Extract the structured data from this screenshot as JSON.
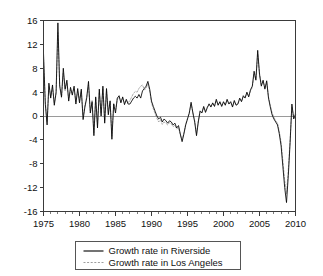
{
  "chart_data": {
    "type": "line",
    "title": "",
    "subtitle": "",
    "xlabel": "",
    "ylabel": "",
    "xlim": [
      1975,
      2010
    ],
    "ylim": [
      -16,
      16
    ],
    "grid": false,
    "zero_line": true,
    "legend_position": "bottom-center",
    "x_ticks": [
      1975,
      1980,
      1985,
      1990,
      1995,
      2000,
      2005,
      2010
    ],
    "x_tick_labels": [
      "1975",
      "1980",
      "1985",
      "1990",
      "1995",
      "2000",
      "2005",
      "2010"
    ],
    "x_minor_tick_step": 1,
    "y_ticks": [
      16,
      12,
      8,
      4,
      0,
      -4,
      -8,
      -12,
      -16
    ],
    "y_tick_labels": [
      "16",
      "12",
      "8",
      "4",
      "0",
      "-4",
      "-8",
      "-12",
      "-16"
    ],
    "colors": {
      "riverside": "#000000",
      "los_angeles": "#9d9d9d",
      "axis": "#3a3a3a",
      "zero_line": "#9a9a9a",
      "background": "#ffffff"
    },
    "series": [
      {
        "name": "Growth rate in Riverside",
        "style": "solid",
        "color": "#000000",
        "x": [
          1975.0,
          1975.25,
          1975.5,
          1975.75,
          1976.0,
          1976.25,
          1976.5,
          1976.75,
          1977.0,
          1977.25,
          1977.5,
          1977.75,
          1978.0,
          1978.25,
          1978.5,
          1978.75,
          1979.0,
          1979.25,
          1979.5,
          1979.75,
          1980.0,
          1980.25,
          1980.5,
          1980.75,
          1981.0,
          1981.25,
          1981.5,
          1981.75,
          1982.0,
          1982.25,
          1982.5,
          1982.75,
          1983.0,
          1983.25,
          1983.5,
          1983.75,
          1984.0,
          1984.25,
          1984.5,
          1984.75,
          1985.0,
          1985.25,
          1985.5,
          1985.75,
          1986.0,
          1986.25,
          1986.5,
          1986.75,
          1987.0,
          1987.25,
          1987.5,
          1987.75,
          1988.0,
          1988.25,
          1988.5,
          1988.75,
          1989.0,
          1989.25,
          1989.5,
          1989.75,
          1990.0,
          1990.25,
          1990.5,
          1990.75,
          1991.0,
          1991.25,
          1991.5,
          1991.75,
          1992.0,
          1992.25,
          1992.5,
          1992.75,
          1993.0,
          1993.25,
          1993.5,
          1993.75,
          1994.0,
          1994.25,
          1994.5,
          1994.75,
          1995.0,
          1995.25,
          1995.5,
          1995.75,
          1996.0,
          1996.25,
          1996.5,
          1996.75,
          1997.0,
          1997.25,
          1997.5,
          1997.75,
          1998.0,
          1998.25,
          1998.5,
          1998.75,
          1999.0,
          1999.25,
          1999.5,
          1999.75,
          2000.0,
          2000.25,
          2000.5,
          2000.75,
          2001.0,
          2001.25,
          2001.5,
          2001.75,
          2002.0,
          2002.25,
          2002.5,
          2002.75,
          2003.0,
          2003.25,
          2003.5,
          2003.75,
          2004.0,
          2004.25,
          2004.5,
          2004.75,
          2005.0,
          2005.25,
          2005.5,
          2005.75,
          2006.0,
          2006.25,
          2006.5,
          2006.75,
          2007.0,
          2007.25,
          2007.5,
          2007.75,
          2008.0,
          2008.25,
          2008.5,
          2008.75,
          2009.0,
          2009.25,
          2009.5,
          2009.75,
          2010.0
        ],
        "values": [
          10.5,
          2.0,
          -1.5,
          5.5,
          3.0,
          5.2,
          1.8,
          4.0,
          15.6,
          5.0,
          3.2,
          8.0,
          4.5,
          6.0,
          2.5,
          4.8,
          3.5,
          5.0,
          2.0,
          4.6,
          2.2,
          4.5,
          -0.6,
          1.5,
          3.0,
          5.8,
          0.5,
          2.4,
          -3.3,
          3.2,
          -2.0,
          4.5,
          0.0,
          5.0,
          -1.2,
          4.6,
          0.2,
          2.5,
          -3.9,
          2.0,
          0.5,
          3.0,
          3.4,
          2.2,
          3.2,
          1.9,
          2.8,
          2.0,
          2.0,
          2.5,
          3.0,
          3.3,
          3.0,
          3.6,
          3.0,
          4.2,
          4.6,
          5.0,
          5.8,
          4.5,
          2.5,
          1.6,
          0.8,
          0.0,
          -0.5,
          -0.2,
          -1.0,
          -0.5,
          -0.8,
          -1.2,
          -0.8,
          -1.0,
          -1.5,
          -1.2,
          -2.0,
          -1.6,
          -3.0,
          -4.3,
          -3.0,
          -1.5,
          -0.5,
          0.5,
          2.3,
          0.5,
          -1.0,
          -3.3,
          -1.0,
          0.8,
          0.5,
          1.6,
          0.6,
          1.4,
          2.0,
          1.5,
          2.2,
          1.6,
          2.8,
          1.8,
          2.4,
          1.6,
          2.4,
          1.8,
          2.8,
          2.0,
          2.4,
          1.5,
          2.6,
          1.8,
          2.0,
          3.0,
          2.4,
          3.4,
          3.0,
          4.0,
          3.2,
          4.4,
          5.0,
          7.5,
          6.0,
          11.0,
          7.0,
          5.0,
          6.0,
          4.5,
          5.9,
          3.0,
          1.5,
          0.2,
          -0.5,
          -1.0,
          -1.5,
          -3.0,
          -5.0,
          -8.5,
          -12.0,
          -14.5,
          -10.0,
          -4.5,
          2.0,
          -0.5,
          0.2
        ]
      },
      {
        "name": "Growth rate in Los Angeles",
        "style": "dashed",
        "color": "#9d9d9d",
        "x": [
          1975.0,
          1975.25,
          1975.5,
          1975.75,
          1976.0,
          1976.25,
          1976.5,
          1976.75,
          1977.0,
          1977.25,
          1977.5,
          1977.75,
          1978.0,
          1978.25,
          1978.5,
          1978.75,
          1979.0,
          1979.25,
          1979.5,
          1979.75,
          1980.0,
          1980.25,
          1980.5,
          1980.75,
          1981.0,
          1981.25,
          1981.5,
          1981.75,
          1982.0,
          1982.25,
          1982.5,
          1982.75,
          1983.0,
          1983.25,
          1983.5,
          1983.75,
          1984.0,
          1984.25,
          1984.5,
          1984.75,
          1985.0,
          1985.25,
          1985.5,
          1985.75,
          1986.0,
          1986.25,
          1986.5,
          1986.75,
          1987.0,
          1987.25,
          1987.5,
          1987.75,
          1988.0,
          1988.25,
          1988.5,
          1988.75,
          1989.0,
          1989.25,
          1989.5,
          1989.75,
          1990.0,
          1990.25,
          1990.5,
          1990.75,
          1991.0,
          1991.25,
          1991.5,
          1991.75,
          1992.0,
          1992.25,
          1992.5,
          1992.75,
          1993.0,
          1993.25,
          1993.5,
          1993.75,
          1994.0,
          1994.25,
          1994.5,
          1994.75,
          1995.0,
          1995.25,
          1995.5,
          1995.75,
          1996.0,
          1996.25,
          1996.5,
          1996.75,
          1997.0,
          1997.25,
          1997.5,
          1997.75,
          1998.0,
          1998.25,
          1998.5,
          1998.75,
          1999.0,
          1999.25,
          1999.5,
          1999.75,
          2000.0,
          2000.25,
          2000.5,
          2000.75,
          2001.0,
          2001.25,
          2001.5,
          2001.75,
          2002.0,
          2002.25,
          2002.5,
          2002.75,
          2003.0,
          2003.25,
          2003.5,
          2003.75,
          2004.0,
          2004.25,
          2004.5,
          2004.75,
          2005.0,
          2005.25,
          2005.5,
          2005.75,
          2006.0,
          2006.25,
          2006.5,
          2006.75,
          2007.0,
          2007.25,
          2007.5,
          2007.75,
          2008.0,
          2008.25,
          2008.5,
          2008.75,
          2009.0,
          2009.25,
          2009.5,
          2009.75,
          2010.0
        ],
        "values": [
          9.6,
          2.4,
          -1.0,
          5.0,
          3.2,
          4.8,
          2.2,
          3.6,
          14.0,
          5.4,
          3.0,
          7.2,
          4.2,
          5.6,
          2.8,
          4.4,
          3.8,
          4.6,
          2.4,
          4.2,
          2.6,
          4.2,
          -0.2,
          1.8,
          3.2,
          5.2,
          0.9,
          2.6,
          -2.8,
          3.0,
          -1.6,
          4.0,
          0.4,
          4.6,
          -0.8,
          4.2,
          0.6,
          2.6,
          -3.4,
          2.2,
          0.9,
          2.8,
          3.2,
          2.4,
          3.0,
          2.1,
          2.6,
          2.2,
          2.6,
          3.2,
          3.8,
          4.1,
          4.0,
          4.6,
          5.0,
          5.2,
          4.4,
          4.6,
          5.4,
          4.2,
          2.2,
          1.2,
          0.4,
          -0.4,
          -1.0,
          -0.6,
          -1.4,
          -1.0,
          -1.2,
          -1.5,
          -1.1,
          -1.3,
          -1.8,
          -1.5,
          -2.2,
          -1.9,
          -3.2,
          -4.0,
          -2.8,
          -1.4,
          -0.4,
          0.6,
          2.0,
          0.6,
          -0.8,
          -3.0,
          -0.8,
          0.9,
          0.6,
          1.5,
          0.8,
          1.5,
          2.1,
          1.6,
          2.1,
          1.7,
          2.6,
          1.9,
          2.3,
          1.7,
          2.3,
          1.9,
          2.6,
          2.1,
          2.3,
          1.6,
          2.4,
          1.9,
          2.1,
          2.8,
          2.5,
          3.2,
          3.1,
          3.8,
          3.3,
          4.2,
          4.8,
          7.0,
          6.2,
          10.4,
          7.2,
          5.2,
          5.8,
          4.7,
          5.6,
          3.2,
          1.8,
          0.5,
          -0.2,
          -0.8,
          -1.2,
          -2.6,
          -4.4,
          -7.6,
          -10.8,
          -13.0,
          -9.0,
          -4.0,
          1.6,
          -0.2,
          0.6
        ]
      }
    ],
    "legend": [
      {
        "label": "Growth rate in Riverside",
        "style": "solid",
        "color": "#000000"
      },
      {
        "label": "Growth rate in Los Angeles",
        "style": "dashed",
        "color": "#9d9d9d"
      }
    ]
  }
}
